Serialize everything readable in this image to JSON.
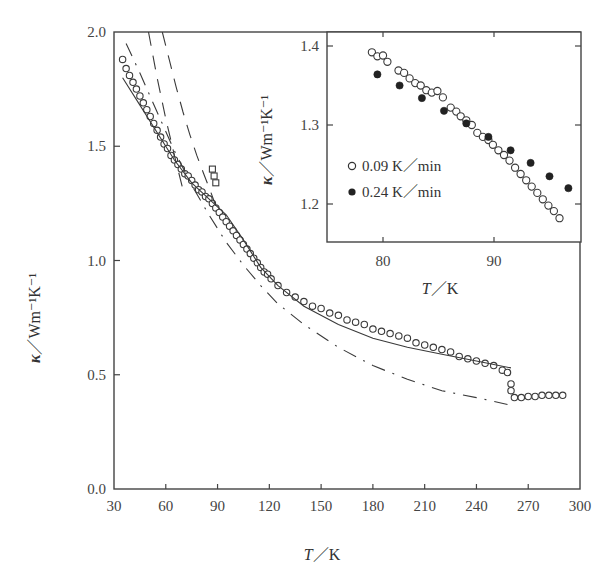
{
  "chart_data": [
    {
      "id": "main",
      "type": "scatter",
      "title": "",
      "xlabel": "T / K",
      "ylabel": "κ / Wm⁻¹K⁻¹",
      "xlim": [
        30,
        300
      ],
      "ylim": [
        0.0,
        2.0
      ],
      "xticks": [
        30,
        60,
        90,
        120,
        150,
        180,
        210,
        240,
        270,
        300
      ],
      "yticks": [
        0.0,
        0.5,
        1.0,
        1.5,
        2.0
      ],
      "ytick_labels": [
        "0.0",
        "0.5",
        "1.0",
        "1.5",
        "2.0"
      ],
      "grid": false,
      "series": [
        {
          "name": "measured (open circles)",
          "style": "open-circle",
          "x": [
            35,
            37,
            39,
            41,
            43,
            45,
            47,
            49,
            51,
            53,
            55,
            57,
            59,
            61,
            63,
            65,
            67,
            69,
            71,
            73,
            75,
            77,
            79,
            81,
            83,
            85,
            87,
            89,
            91,
            93,
            95,
            97,
            99,
            101,
            103,
            105,
            107,
            109,
            111,
            113,
            115,
            117,
            119,
            121,
            125,
            130,
            135,
            140,
            145,
            150,
            155,
            160,
            165,
            170,
            175,
            180,
            185,
            190,
            195,
            200,
            205,
            210,
            215,
            220,
            225,
            230,
            235,
            240,
            245,
            250,
            255,
            258,
            260,
            260,
            262,
            266,
            270,
            274,
            278,
            282,
            286,
            290
          ],
          "y": [
            1.88,
            1.84,
            1.81,
            1.78,
            1.75,
            1.72,
            1.69,
            1.66,
            1.63,
            1.6,
            1.57,
            1.54,
            1.51,
            1.49,
            1.46,
            1.44,
            1.42,
            1.4,
            1.38,
            1.37,
            1.35,
            1.33,
            1.31,
            1.3,
            1.28,
            1.27,
            1.25,
            1.23,
            1.21,
            1.19,
            1.17,
            1.15,
            1.13,
            1.11,
            1.09,
            1.07,
            1.05,
            1.03,
            1.01,
            0.99,
            0.97,
            0.95,
            0.94,
            0.92,
            0.89,
            0.86,
            0.84,
            0.82,
            0.8,
            0.79,
            0.77,
            0.76,
            0.74,
            0.73,
            0.72,
            0.7,
            0.69,
            0.68,
            0.67,
            0.66,
            0.64,
            0.63,
            0.62,
            0.61,
            0.6,
            0.58,
            0.57,
            0.56,
            0.55,
            0.54,
            0.52,
            0.51,
            0.46,
            0.43,
            0.4,
            0.4,
            0.405,
            0.405,
            0.41,
            0.41,
            0.41,
            0.41
          ]
        },
        {
          "name": "squares near 88 K",
          "style": "open-square",
          "x": [
            87,
            88,
            89
          ],
          "y": [
            1.4,
            1.37,
            1.34
          ]
        },
        {
          "name": "model (solid)",
          "style": "solid-line",
          "x": [
            35,
            45,
            55,
            65,
            75,
            85,
            95,
            105,
            115,
            125,
            140,
            160,
            180,
            200,
            220,
            240,
            260
          ],
          "y": [
            1.8,
            1.68,
            1.56,
            1.44,
            1.34,
            1.27,
            1.2,
            1.09,
            0.97,
            0.89,
            0.8,
            0.72,
            0.66,
            0.62,
            0.59,
            0.56,
            0.53
          ]
        },
        {
          "name": "model (long dash)",
          "style": "dash-line",
          "x": [
            50,
            55,
            60,
            65,
            70
          ],
          "y": [
            2.0,
            1.8,
            1.62,
            1.46,
            1.31
          ]
        },
        {
          "name": "model (long dash 2)",
          "style": "dash-line",
          "x": [
            58,
            62,
            66,
            70,
            74,
            78,
            82,
            86,
            89
          ],
          "y": [
            2.0,
            1.88,
            1.76,
            1.65,
            1.55,
            1.46,
            1.38,
            1.3,
            1.24
          ]
        },
        {
          "name": "model (dash-dot)",
          "style": "dash-dot-line",
          "x": [
            37,
            45,
            55,
            65,
            75,
            85,
            95,
            105,
            115,
            125,
            140,
            160,
            180,
            200,
            220,
            240,
            258
          ],
          "y": [
            1.95,
            1.82,
            1.65,
            1.48,
            1.33,
            1.2,
            1.08,
            0.98,
            0.89,
            0.81,
            0.72,
            0.62,
            0.54,
            0.48,
            0.43,
            0.4,
            0.37
          ]
        }
      ]
    },
    {
      "id": "inset",
      "type": "scatter",
      "xlabel": "T / K",
      "ylabel": "κ / Wm⁻¹K⁻¹",
      "xlim": [
        75,
        98
      ],
      "ylim": [
        1.15,
        1.42
      ],
      "xticks": [
        80,
        90
      ],
      "yticks": [
        1.2,
        1.3,
        1.4
      ],
      "ytick_labels": [
        "1.2",
        "1.3",
        "1.4"
      ],
      "legend_position": "left-middle",
      "series": [
        {
          "name": "0.09 K/min",
          "style": "open-circle",
          "x": [
            79.0,
            79.5,
            80.0,
            80.4,
            81.4,
            81.9,
            82.4,
            82.9,
            83.4,
            83.9,
            84.4,
            84.9,
            85.4,
            86.1,
            86.6,
            87.0,
            87.5,
            88.0,
            88.5,
            89.0,
            89.5,
            89.9,
            90.4,
            90.9,
            91.4,
            91.9,
            92.4,
            92.9,
            93.4,
            93.9,
            94.4,
            94.9,
            95.4,
            95.9
          ],
          "y": [
            1.392,
            1.387,
            1.388,
            1.38,
            1.369,
            1.366,
            1.359,
            1.353,
            1.35,
            1.344,
            1.341,
            1.343,
            1.335,
            1.322,
            1.317,
            1.311,
            1.306,
            1.3,
            1.29,
            1.285,
            1.281,
            1.275,
            1.268,
            1.262,
            1.255,
            1.246,
            1.238,
            1.23,
            1.222,
            1.214,
            1.206,
            1.198,
            1.191,
            1.182
          ]
        },
        {
          "name": "0.24 K/min",
          "style": "filled-circle",
          "x": [
            79.5,
            81.5,
            83.5,
            85.5,
            87.5,
            89.5,
            91.5,
            93.3,
            95.0,
            96.7
          ],
          "y": [
            1.364,
            1.35,
            1.334,
            1.318,
            1.302,
            1.285,
            1.268,
            1.252,
            1.235,
            1.22
          ]
        }
      ],
      "legend": [
        "0.09 K／min",
        "0.24 K／min"
      ]
    }
  ],
  "labels": {
    "main_y_title_kappa": "κ",
    "main_y_title_unit": "／Wm⁻¹K⁻¹",
    "main_x_title_T": "T",
    "main_x_title_unit": "／K",
    "inset_y_title_kappa": "κ",
    "inset_y_title_unit": "／Wm⁻¹K⁻¹",
    "inset_x_title_T": "T",
    "inset_x_title_unit": "／K",
    "legend_open": "0.09 K／min",
    "legend_filled": "0.24 K／min"
  },
  "colors": {
    "ink": "#3a3a3a",
    "axis": "#444444",
    "background": "#ffffff"
  }
}
